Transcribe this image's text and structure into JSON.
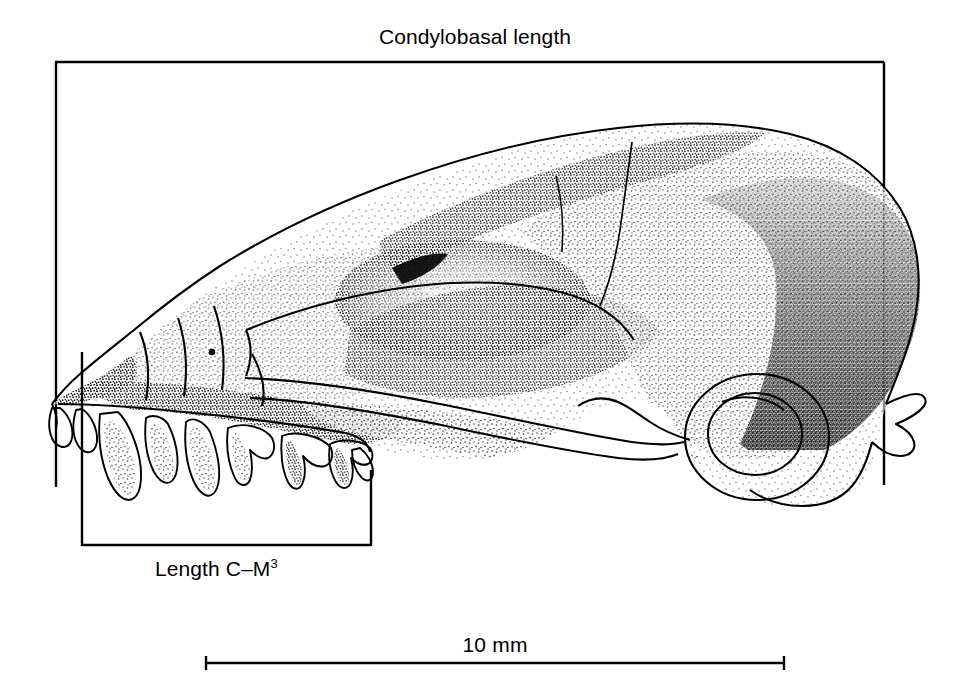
{
  "figure": {
    "kind": "scientific-illustration",
    "background_color": "#ffffff",
    "ink_color": "#000000",
    "width": 977,
    "height": 692
  },
  "measurements": {
    "condylobasal": {
      "label": "Condylobasal length",
      "bracket": {
        "orientation": "top",
        "rail_y": 62,
        "x_start": 55,
        "x_end": 884,
        "left_tick_end_y": 487,
        "right_tick_end_y": 485
      }
    },
    "toothrow": {
      "label": "Length C–M",
      "superscript": "3",
      "bracket": {
        "orientation": "bottom",
        "rail_y": 546,
        "x_start": 82,
        "x_end": 371,
        "left_tick_start_y": 352,
        "right_tick_start_y": 470
      }
    }
  },
  "scale_bar": {
    "label": "10 mm",
    "x_start": 205,
    "x_end": 785,
    "y": 663,
    "cap_height": 14
  }
}
